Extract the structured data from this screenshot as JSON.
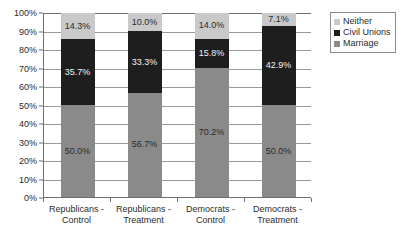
{
  "chart_data": {
    "type": "bar",
    "subtype": "stacked-100-percent",
    "title": "",
    "subtitle": "",
    "xlabel": "",
    "ylabel": "",
    "ylim": [
      0,
      100
    ],
    "grid": true,
    "legend_position": "top-right",
    "categories": [
      "Republicans - Control",
      "Republicans - Treatment",
      "Democrats - Control",
      "Democrats - Treatment"
    ],
    "category_lines": [
      [
        "Republicans -",
        "Control"
      ],
      [
        "Republicans -",
        "Treatment"
      ],
      [
        "Democrats -",
        "Control"
      ],
      [
        "Democrats -",
        "Treatment"
      ]
    ],
    "stack_order_bottom_to_top": [
      "Marriage",
      "Civil Unions",
      "Neither"
    ],
    "series": [
      {
        "name": "Marriage",
        "color": "#8a8a8a",
        "values": [
          50.0,
          56.7,
          70.2,
          50.0
        ],
        "labels": [
          "50.0%",
          "56.7%",
          "70.2%",
          "50.0%"
        ]
      },
      {
        "name": "Civil Unions",
        "color": "#1e1e1e",
        "values": [
          35.7,
          33.3,
          15.8,
          42.9
        ],
        "labels": [
          "35.7%",
          "33.3%",
          "15.8%",
          "42.9%"
        ]
      },
      {
        "name": "Neither",
        "color": "#c9c9c9",
        "values": [
          14.3,
          10.0,
          14.0,
          7.1
        ],
        "labels": [
          "14.3%",
          "10.0%",
          "14.0%",
          "7.1%"
        ]
      }
    ],
    "yticks": [
      0,
      10,
      20,
      30,
      40,
      50,
      60,
      70,
      80,
      90,
      100
    ],
    "ytick_labels": [
      "0%",
      "10%",
      "20%",
      "30%",
      "40%",
      "50%",
      "60%",
      "70%",
      "80%",
      "90%",
      "100%"
    ]
  },
  "legend": {
    "entries": [
      {
        "label": "Neither",
        "color": "#c9c9c9"
      },
      {
        "label": "Civil Unions",
        "color": "#1e1e1e"
      },
      {
        "label": "Marriage",
        "color": "#8a8a8a"
      }
    ]
  },
  "colors": {
    "background": "#ffffff",
    "axis": "#6e6e6e",
    "gridline": "#9a9a9a",
    "text": "#2b2b2b",
    "neither": "#c9c9c9",
    "civil_unions": "#1e1e1e",
    "marriage": "#8a8a8a"
  }
}
